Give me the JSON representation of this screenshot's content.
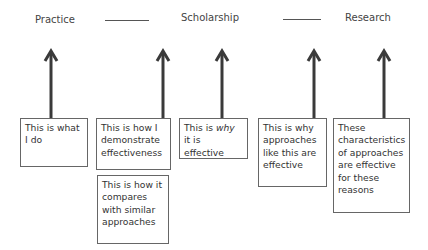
{
  "headers": {
    "practice": "Practice",
    "scholarship": "Scholarship",
    "research": "Research"
  },
  "boxes": [
    {
      "id": "practice-what",
      "text": "This is what I do"
    },
    {
      "id": "scholarship-how",
      "text": "This is how I demonstrate effectiveness"
    },
    {
      "id": "scholarship-compare",
      "text": "This is how it compares with similar approaches"
    },
    {
      "id": "scholarship-why",
      "prefix": "This is ",
      "emphasis": "why",
      "suffix": " it is effective"
    },
    {
      "id": "research-why",
      "text": "This is why approaches like this are effective"
    },
    {
      "id": "research-characteristics",
      "text": "These characteristics of approaches are effective for these reasons"
    }
  ],
  "colors": {
    "arrow": "#3a3a3a",
    "border": "#666666",
    "text": "#333333"
  }
}
